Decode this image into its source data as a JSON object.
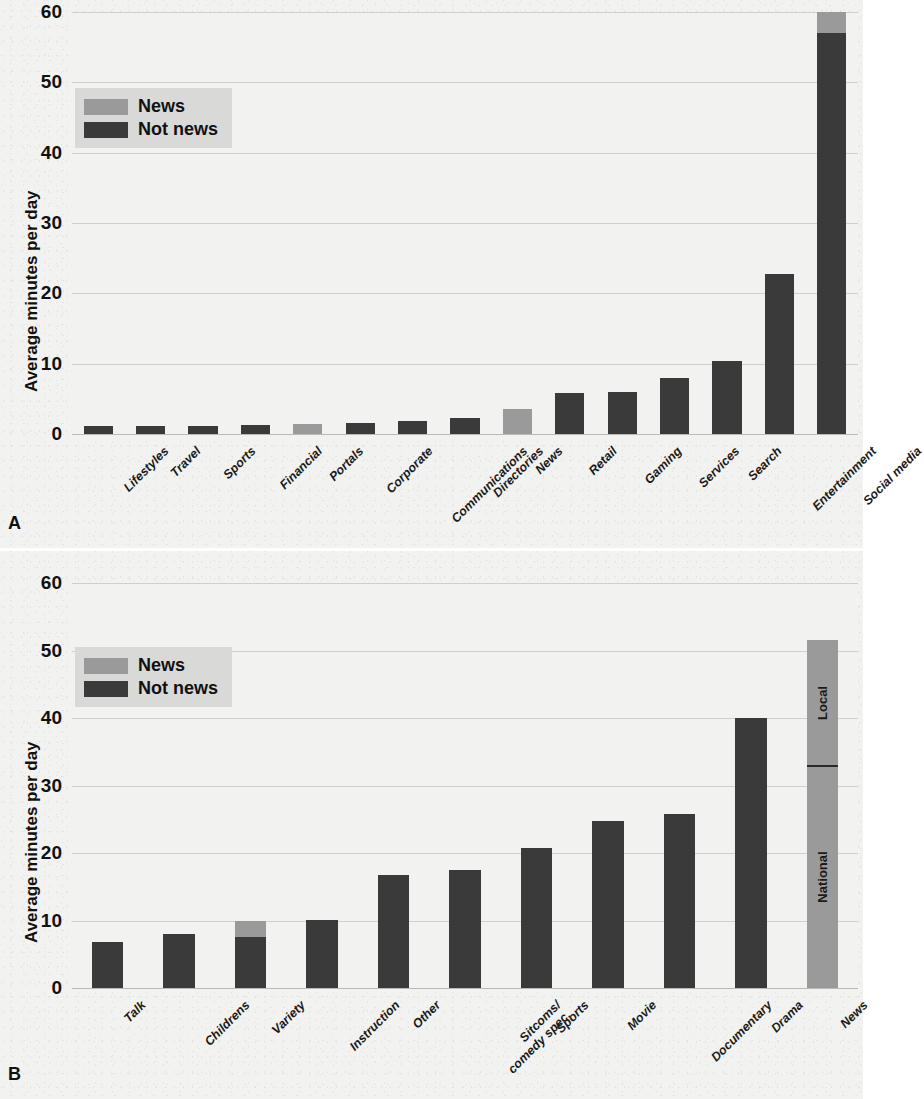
{
  "figure": {
    "panels": [
      {
        "letter": "A"
      },
      {
        "letter": "B"
      }
    ]
  },
  "legend": {
    "news_label": "News",
    "notnews_label": "Not news",
    "news_color": "#9a9a9a",
    "notnews_color": "#3a3a3a"
  },
  "panel_a": {
    "letter": "A",
    "title": "Online (mobile + desktop) media consumption, all (ages 18+)",
    "ylabel": "Average minutes per day",
    "yticks": [
      "60",
      "50",
      "40",
      "30",
      "20",
      "10",
      "0"
    ],
    "xticks": [
      "Lifestyles",
      "Travel",
      "Sports",
      "Financial",
      "Portals",
      "Corporate",
      "Communications",
      "Directories",
      "News",
      "Retail",
      "Gaming",
      "Services",
      "Search",
      "Entertainment",
      "Social media"
    ]
  },
  "panel_b": {
    "letter": "B",
    "title": "Television media consumption, all (ages 18+))",
    "ylabel": "Average minutes per day",
    "yticks": [
      "60",
      "50",
      "40",
      "30",
      "20",
      "10",
      "0"
    ],
    "xticks": [
      "Talk",
      "Childrens",
      "Variety",
      "Instruction",
      "Other",
      "Sitcoms/\ncomedy spec.",
      "Sports",
      "Movie",
      "Documentary",
      "Drama",
      "News"
    ],
    "news_bar_segments": {
      "national": "National",
      "local": "Local"
    }
  },
  "chart_data": [
    {
      "type": "bar",
      "id": "panel-a",
      "panel_letter": "A",
      "title": "Online (mobile + desktop) media consumption, all (ages 18+)",
      "xlabel": "",
      "ylabel": "Average minutes per day",
      "ylim": [
        0,
        60
      ],
      "yticks": [
        0,
        10,
        20,
        30,
        40,
        50,
        60
      ],
      "grid": "horizontal",
      "stacked": true,
      "legend": {
        "position": "upper-left",
        "entries": [
          "News",
          "Not news"
        ]
      },
      "colors": {
        "News": "#9a9a9a",
        "Not news": "#3a3a3a"
      },
      "categories": [
        "Lifestyles",
        "Travel",
        "Sports",
        "Financial",
        "Portals",
        "Corporate",
        "Communications",
        "Directories",
        "News",
        "Retail",
        "Gaming",
        "Services",
        "Search",
        "Entertainment",
        "Social media"
      ],
      "series": [
        {
          "name": "Not news",
          "values": [
            1.1,
            1.1,
            1.2,
            1.3,
            0.0,
            1.5,
            1.9,
            2.3,
            0.0,
            5.8,
            6.0,
            8.0,
            10.4,
            22.8,
            57.0
          ]
        },
        {
          "name": "News",
          "values": [
            0.0,
            0.0,
            0.0,
            0.0,
            1.4,
            0.0,
            0.0,
            0.0,
            3.5,
            0.0,
            0.0,
            0.0,
            0.0,
            0.0,
            3.0
          ]
        }
      ],
      "totals": [
        1.1,
        1.1,
        1.2,
        1.3,
        1.4,
        1.5,
        1.9,
        2.3,
        3.5,
        5.8,
        6.0,
        8.0,
        10.4,
        22.8,
        60.0
      ]
    },
    {
      "type": "bar",
      "id": "panel-b",
      "panel_letter": "B",
      "title": "Television media consumption, all (ages 18+))",
      "xlabel": "",
      "ylabel": "Average minutes per day",
      "ylim": [
        0,
        60
      ],
      "yticks": [
        0,
        10,
        20,
        30,
        40,
        50,
        60
      ],
      "grid": "horizontal",
      "stacked": true,
      "legend": {
        "position": "upper-left",
        "entries": [
          "News",
          "Not news"
        ]
      },
      "colors": {
        "News": "#9a9a9a",
        "Not news": "#3a3a3a"
      },
      "categories": [
        "Talk",
        "Childrens",
        "Variety",
        "Instruction",
        "Other",
        "Sitcoms/comedy spec.",
        "Sports",
        "Movie",
        "Documentary",
        "Drama",
        "News"
      ],
      "series": [
        {
          "name": "Not news",
          "values": [
            6.8,
            8.0,
            7.5,
            10.1,
            16.7,
            17.5,
            20.8,
            24.7,
            25.8,
            40.0,
            0.0
          ]
        },
        {
          "name": "News",
          "values": [
            0.0,
            0.0,
            2.5,
            0.0,
            0.0,
            0.0,
            0.0,
            0.0,
            0.0,
            0.0,
            51.5
          ]
        }
      ],
      "totals": [
        6.8,
        8.0,
        10.0,
        10.1,
        16.7,
        17.5,
        20.8,
        24.7,
        25.8,
        40.0,
        51.5
      ],
      "annotations": [
        {
          "category": "News",
          "label": "National",
          "from": 0.0,
          "to": 33.0
        },
        {
          "category": "News",
          "label": "Local",
          "from": 33.0,
          "to": 51.5
        }
      ]
    }
  ]
}
